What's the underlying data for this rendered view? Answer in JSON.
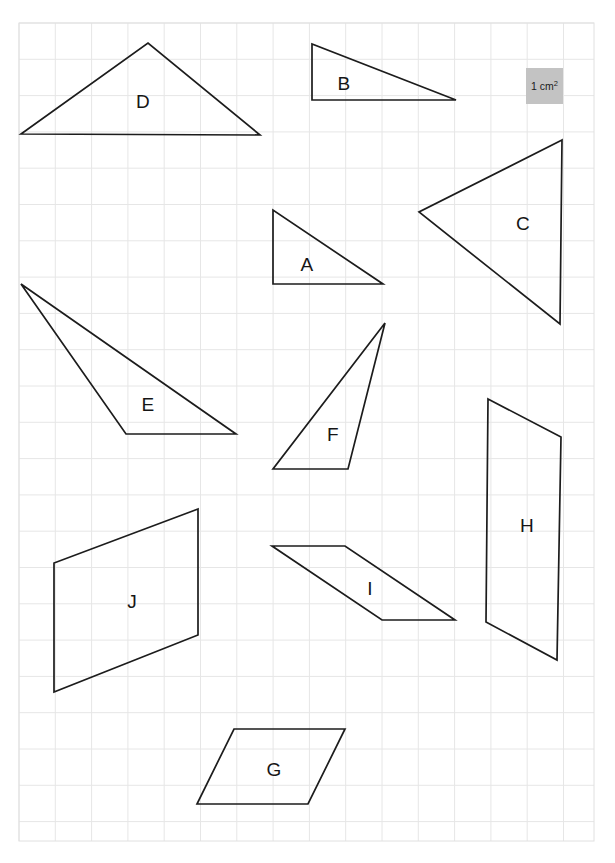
{
  "page": {
    "background_color": "#ffffff",
    "width": 615,
    "height": 863
  },
  "grid": {
    "line_color": "#e6e6e6",
    "border_color": "#e0e0e0",
    "origin_x": 19,
    "origin_y": 23,
    "cell_size": 36.3,
    "cols": 16,
    "rows": 22.5,
    "right": 594,
    "bottom": 841
  },
  "key": {
    "name": "area-key",
    "label_prefix": "1 cm",
    "label_sup": "2",
    "label_full": "1 cm²",
    "fill_color": "#c3c3c3",
    "x": 526,
    "y": 68,
    "width": 37,
    "height": 36
  },
  "shapes": [
    {
      "id": "A",
      "label": "A",
      "type": "right-triangle",
      "points": "273,210 273,284 383,284",
      "label_x": 307,
      "label_y": 265
    },
    {
      "id": "B",
      "label": "B",
      "type": "right-triangle",
      "points": "312,44 312,100 456,100",
      "label_x": 344,
      "label_y": 84
    },
    {
      "id": "C",
      "label": "C",
      "type": "triangle",
      "points": "562,140 419,212 560,324",
      "label_x": 523,
      "label_y": 224
    },
    {
      "id": "D",
      "label": "D",
      "type": "triangle",
      "points": "21,134 148,43 260,135",
      "label_x": 143,
      "label_y": 102
    },
    {
      "id": "E",
      "label": "E",
      "type": "triangle",
      "points": "21,284 236,434 126,434",
      "label_x": 148,
      "label_y": 405
    },
    {
      "id": "F",
      "label": "F",
      "type": "triangle",
      "points": "385,323 273,469 348,469",
      "label_x": 333,
      "label_y": 435
    },
    {
      "id": "G",
      "label": "G",
      "type": "parallelogram",
      "points": "234,729 345,729 308,804 197,804",
      "label_x": 274,
      "label_y": 770
    },
    {
      "id": "H",
      "label": "H",
      "type": "parallelogram",
      "points": "488,399 561,437 557,660 486,622",
      "label_x": 527,
      "label_y": 526
    },
    {
      "id": "I",
      "label": "I",
      "type": "parallelogram",
      "points": "272,546 345,546 455,620 382,620",
      "label_x": 370,
      "label_y": 589
    },
    {
      "id": "J",
      "label": "J",
      "type": "parallelogram",
      "points": "198,509 54,563 54,692 198,635",
      "label_x": 132,
      "label_y": 602
    }
  ],
  "stroke": {
    "color": "#1c1c1c",
    "width": 1.7
  }
}
